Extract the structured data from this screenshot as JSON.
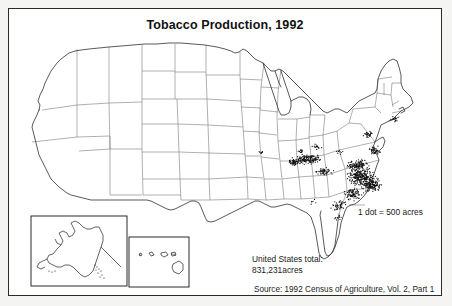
{
  "figure": {
    "title": "Tobacco Production, 1992",
    "legend": "1 dot = 500 acres",
    "total_label": "United States total:",
    "total_value": "831,231acres",
    "source": "Source: 1992 Census of Agriculture, Vol. 2, Part 1",
    "colors": {
      "frame": "#2b2b2b",
      "state_outline": "#6e6e6e",
      "coast_outline": "#3c3c3c",
      "dot": "#111111",
      "page_background": "#f4f4f3",
      "map_background": "#ffffff"
    }
  },
  "chart_data": {
    "type": "map",
    "map_kind": "dot-density",
    "title": "Tobacco Production, 1992",
    "unit": "acres",
    "dot_value": 500,
    "legend": "1 dot = 500 acres",
    "national_total": 831231,
    "national_total_text": "831,231acres",
    "source": "Source: 1992 Census of Agriculture, Vol. 2, Part 1",
    "insets": [
      "Alaska",
      "Hawaii"
    ],
    "clusters": [
      {
        "region": "North Carolina - Coastal Plain / Piedmont",
        "x": 352,
        "y": 168,
        "rx": 17,
        "ry": 11,
        "dots": 260,
        "intensity": "very-high"
      },
      {
        "region": "North Carolina - Inner Coastal Plain",
        "x": 362,
        "y": 176,
        "rx": 12,
        "ry": 8,
        "dots": 150,
        "intensity": "very-high"
      },
      {
        "region": "Virginia - Southside",
        "x": 349,
        "y": 156,
        "rx": 14,
        "ry": 7,
        "dots": 120,
        "intensity": "high"
      },
      {
        "region": "Kentucky - Bluegrass",
        "x": 300,
        "y": 150,
        "rx": 16,
        "ry": 6,
        "dots": 150,
        "intensity": "high"
      },
      {
        "region": "Kentucky - Western Pennyroyal",
        "x": 285,
        "y": 153,
        "rx": 9,
        "ry": 5,
        "dots": 60,
        "intensity": "medium"
      },
      {
        "region": "Tennessee - Upper Cumberland",
        "x": 315,
        "y": 163,
        "rx": 10,
        "ry": 5,
        "dots": 55,
        "intensity": "medium"
      },
      {
        "region": "South Carolina - Pee Dee",
        "x": 344,
        "y": 185,
        "rx": 11,
        "ry": 8,
        "dots": 85,
        "intensity": "high"
      },
      {
        "region": "Georgia - South",
        "x": 330,
        "y": 196,
        "rx": 11,
        "ry": 7,
        "dots": 45,
        "intensity": "medium"
      },
      {
        "region": "Virginia / Maryland - Southern Maryland",
        "x": 366,
        "y": 142,
        "rx": 7,
        "ry": 6,
        "dots": 45,
        "intensity": "medium"
      },
      {
        "region": "Pennsylvania - Lancaster County",
        "x": 359,
        "y": 125,
        "rx": 6,
        "ry": 4,
        "dots": 30,
        "intensity": "medium"
      },
      {
        "region": "Ohio - Brown County",
        "x": 308,
        "y": 138,
        "rx": 6,
        "ry": 4,
        "dots": 18,
        "intensity": "low"
      },
      {
        "region": "Connecticut River Valley",
        "x": 385,
        "y": 110,
        "rx": 5,
        "ry": 4,
        "dots": 14,
        "intensity": "low"
      },
      {
        "region": "Florida - North",
        "x": 330,
        "y": 208,
        "rx": 6,
        "ry": 4,
        "dots": 10,
        "intensity": "low"
      },
      {
        "region": "Indiana - Southern",
        "x": 292,
        "y": 142,
        "rx": 6,
        "ry": 3,
        "dots": 12,
        "intensity": "low"
      },
      {
        "region": "Missouri - Weston area",
        "x": 252,
        "y": 143,
        "rx": 5,
        "ry": 3,
        "dots": 8,
        "intensity": "low"
      },
      {
        "region": "West Virginia",
        "x": 330,
        "y": 143,
        "rx": 5,
        "ry": 4,
        "dots": 8,
        "intensity": "low"
      },
      {
        "region": "Alabama / Gulf",
        "x": 305,
        "y": 192,
        "rx": 6,
        "ry": 4,
        "dots": 6,
        "intensity": "low"
      }
    ]
  }
}
